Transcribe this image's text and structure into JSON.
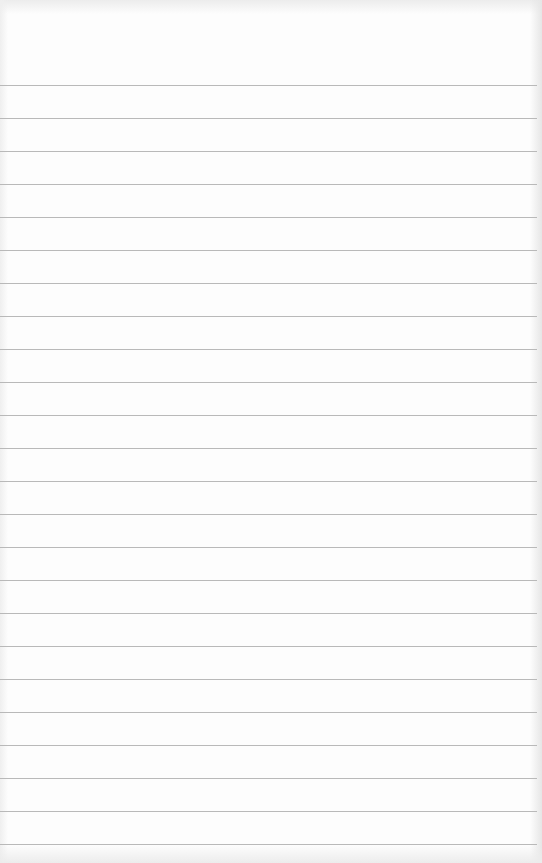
{
  "sheet": {
    "type": "blank-lined-paper",
    "background_color": "#fdfdfd",
    "rule_color": "#b9b9b9",
    "rule_start_y": 85,
    "rule_spacing": 33,
    "rule_count": 24,
    "rule_width": 537,
    "text_content": []
  }
}
